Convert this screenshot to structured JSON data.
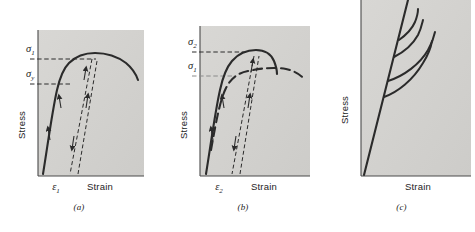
{
  "figure": {
    "panels": [
      {
        "id": "a",
        "caption": "(a)",
        "axes": {
          "y_label": "Stress",
          "x_label": "Strain"
        },
        "stress_levels": [
          {
            "symbol": "σ",
            "subscript": "1",
            "value_frac": 0.8
          },
          {
            "symbol": "σ",
            "subscript": "y",
            "value_frac": 0.63
          }
        ],
        "strain_marks": [
          {
            "symbol": "ε",
            "subscript": "1"
          }
        ],
        "curves": [
          {
            "name": "loading-curve",
            "style": "solid"
          },
          {
            "name": "unload-reload-loop",
            "style": "dashed"
          }
        ]
      },
      {
        "id": "b",
        "caption": "(b)",
        "axes": {
          "y_label": "Stress",
          "x_label": "Strain"
        },
        "stress_levels": [
          {
            "symbol": "σ",
            "subscript": "2",
            "value_frac": 0.84
          },
          {
            "symbol": "σ",
            "subscript": "1",
            "value_frac": 0.69
          }
        ],
        "strain_marks": [
          {
            "symbol": "ε",
            "subscript": "2"
          }
        ],
        "curves": [
          {
            "name": "strain-hardened-curve",
            "style": "solid"
          },
          {
            "name": "original-curve",
            "style": "dashed"
          },
          {
            "name": "unload-reload-loop",
            "style": "dashed"
          }
        ]
      },
      {
        "id": "c",
        "caption": "(c)",
        "axes": {
          "y_label": "Stress",
          "x_label": "Strain"
        },
        "stress_levels": [],
        "strain_marks": [],
        "curves": [
          {
            "name": "elastic-line",
            "style": "solid"
          },
          {
            "name": "branch-curve-1",
            "style": "solid"
          },
          {
            "name": "branch-curve-2",
            "style": "solid"
          },
          {
            "name": "branch-curve-3",
            "style": "solid"
          },
          {
            "name": "branch-curve-4",
            "style": "solid"
          }
        ]
      }
    ]
  },
  "colors": {
    "plot_background": "#d4d3d0",
    "curve": "#2b2b2b",
    "axis": "#4a4a4a",
    "text": "#1d1d1d",
    "page_background": "#ffffff"
  }
}
